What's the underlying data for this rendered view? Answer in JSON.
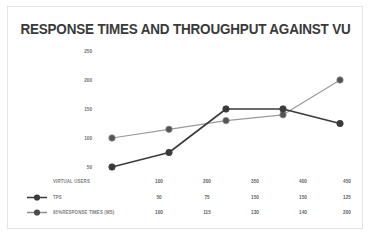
{
  "chart_data": {
    "type": "line",
    "title": "RESPONSE TIMES AND THROUGHPUT AGAINST VU",
    "xlabel": "VIRTUAL USERS",
    "ylabel": "",
    "categories": [
      "100",
      "200",
      "350",
      "400",
      "450"
    ],
    "yticks": [
      "250",
      "200",
      "150",
      "100",
      "50"
    ],
    "ylim": [
      0,
      250
    ],
    "grid": false,
    "legend_position": "bottom-left-table",
    "series": [
      {
        "name": "TPS",
        "color": "#3b3b3b",
        "marker": "circle-filled",
        "values": [
          50,
          75,
          150,
          150,
          125
        ]
      },
      {
        "name": "95%RESPONSE TIMES (MS)",
        "color": "#9b9b9b",
        "marker": "circle-filled",
        "values": [
          100,
          115,
          130,
          140,
          200
        ]
      }
    ]
  },
  "table": {
    "header_label": "VIRTUAL USERS",
    "header_values": [
      "100",
      "200",
      "350",
      "400",
      "450"
    ],
    "rows": [
      {
        "label": "TPS",
        "values": [
          "50",
          "75",
          "150",
          "150",
          "125"
        ]
      },
      {
        "label": "95%RESPONSE TIMES (MS)",
        "values": [
          "100",
          "115",
          "130",
          "140",
          "200"
        ]
      }
    ]
  },
  "colors": {
    "series_tps": "#3b3b3b",
    "series_response": "#9b9b9b",
    "border": "#e3e3e3",
    "title": "#3a3a3a",
    "background": "#ffffff"
  }
}
